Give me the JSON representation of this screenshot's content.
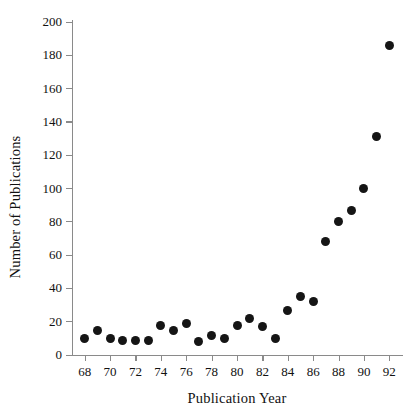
{
  "chart_data": {
    "type": "scatter",
    "title": "",
    "xlabel": "Publication Year",
    "ylabel": "Number of Publications",
    "xlim": [
      67,
      93
    ],
    "ylim": [
      0,
      200
    ],
    "grid": false,
    "legend": null,
    "x_tick_labels": [
      "68",
      "70",
      "72",
      "74",
      "76",
      "78",
      "80",
      "82",
      "84",
      "86",
      "88",
      "90",
      "92"
    ],
    "x_ticks": [
      68,
      70,
      72,
      74,
      76,
      78,
      80,
      82,
      84,
      86,
      88,
      90,
      92
    ],
    "y_tick_labels": [
      "0",
      "20",
      "40",
      "60",
      "80",
      "100",
      "120",
      "140",
      "160",
      "180",
      "200"
    ],
    "y_ticks": [
      0,
      20,
      40,
      60,
      80,
      100,
      120,
      140,
      160,
      180,
      200
    ],
    "marker": "filled-circle",
    "marker_color": "#151515",
    "x": [
      68,
      69,
      70,
      71,
      72,
      73,
      74,
      75,
      76,
      77,
      78,
      79,
      80,
      81,
      82,
      83,
      84,
      85,
      86,
      87,
      88,
      89,
      90,
      91,
      92
    ],
    "y": [
      10,
      15,
      10,
      9,
      9,
      9,
      18,
      15,
      19,
      8,
      12,
      10,
      18,
      22,
      17,
      10,
      27,
      35,
      32,
      68,
      80,
      87,
      100,
      131,
      186
    ]
  }
}
